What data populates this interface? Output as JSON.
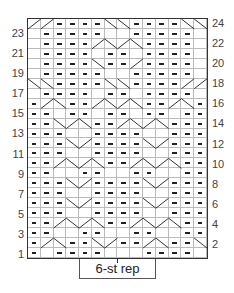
{
  "chart": {
    "columns": 14,
    "rows": 24,
    "grid": [
      "//----\\\\----\\\\",
      ".-----..-----.",
      ".----/\\/\\----.",
      ".----.--.----.",
      ".----\\--/----.",
      ".-----..-----.",
      "\\\\----\\\\----//",
      ".----.--.----.",
      "-/\\--/\\/\\--/\\-",
      "--.--.--.--.--",
      "--\\/\\--/\\/\\---",
      "---..----..---",
      "---\\/----\\/---",
      "---..----..---",
      "--/\\/\\--/\\/\\--",
      "--..--..--..--",
      "---\\/----\\/---",
      "---..----..---",
      "---\\/----\\/---",
      "---..----..---",
      "--/\\/\\--/\\/\\--",
      "--..--..--..--",
      "-/\\--\\/--/\\--\\",
      "-.----...----.-"
    ],
    "left_row_labels": [
      "23",
      "21",
      "19",
      "17",
      "15",
      "13",
      "11",
      "9",
      "7",
      "5",
      "3",
      "1"
    ],
    "right_row_labels": [
      "24",
      "22",
      "20",
      "18",
      "16",
      "14",
      "12",
      "10",
      "8",
      "6",
      "4",
      "2"
    ],
    "repeat_label": "6-st rep"
  },
  "legend_symbols": {
    "-": "purl",
    ".": "knit",
    "/": "cable-right",
    "\\": "cable-left"
  }
}
